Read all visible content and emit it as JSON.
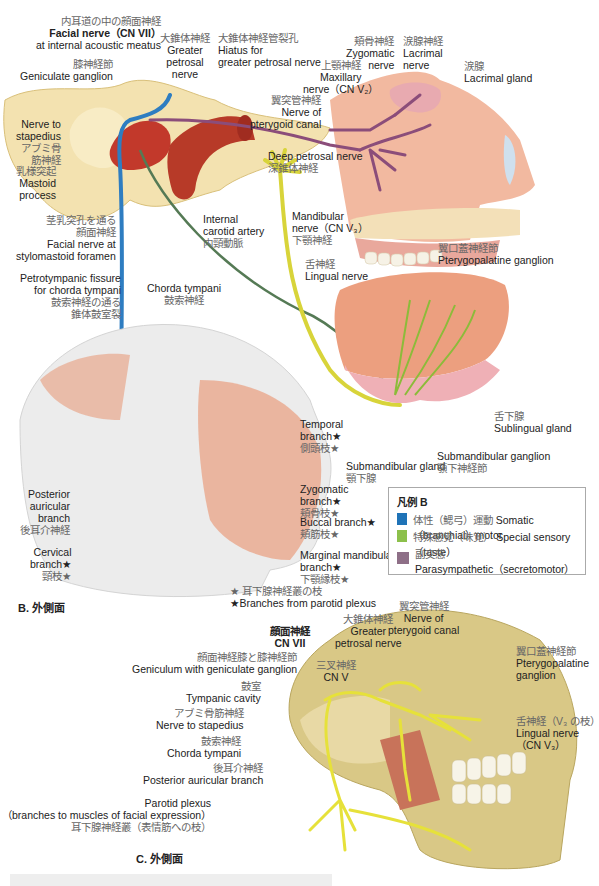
{
  "figure_B": {
    "caption": "B. 外側面",
    "labels": {
      "facial_nerve_iam": {
        "jp": "内耳道の中の顔面神経",
        "en1": "Facial nerve（CN VII）",
        "en2": "at internal acoustic meatus"
      },
      "geniculate_ganglion": {
        "jp": "膝神経節",
        "en": "Geniculate ganglion"
      },
      "greater_petrosal": {
        "jp": "大錐体神経",
        "en1": "Greater",
        "en2": "petrosal",
        "en3": "nerve"
      },
      "hiatus": {
        "jp": "大錐体神経管裂孔",
        "en1": "Hiatus for",
        "en2": "greater petrosal nerve"
      },
      "maxillary": {
        "jp": "上顎神経",
        "en1": "Maxillary",
        "en2": "nerve（CN V₂）"
      },
      "zygomatic_nerve": {
        "jp": "頬骨神経",
        "en1": "Zygomatic",
        "en2": "nerve"
      },
      "lacrimal_nerve": {
        "jp": "涙腺神経",
        "en1": "Lacrimal",
        "en2": "nerve"
      },
      "lacrimal_gland": {
        "jp": "涙腺",
        "en": "Lacrimal gland"
      },
      "pterygoid_canal": {
        "jp": "翼突管神経",
        "en1": "Nerve of",
        "en2": "pterygoid canal"
      },
      "nerve_to_stapedius": {
        "en1": "Nerve to",
        "en2": "stapedius",
        "jp1": "アブミ骨",
        "jp2": "筋神経"
      },
      "mastoid": {
        "jp": "乳様突起",
        "en1": "Mastoid",
        "en2": "process"
      },
      "deep_petrosal": {
        "en": "Deep petrosal nerve",
        "jp": "深錐体神経"
      },
      "internal_carotid": {
        "en1": "Internal",
        "en2": "carotid artery",
        "jp": "内頸動脈"
      },
      "mandibular": {
        "en1": "Mandibular",
        "en2": "nerve（CN V₃）",
        "jp": "下顎神経"
      },
      "pterygopalatine": {
        "jp": "翼口蓋神経節",
        "en": "Pterygopalatine ganglion"
      },
      "stylomastoid": {
        "jp1": "茎乳突孔を通る",
        "jp2": "顔面神経",
        "en1": "Facial nerve at",
        "en2": "stylomastoid foramen"
      },
      "lingual": {
        "jp": "舌神経",
        "en": "Lingual nerve"
      },
      "petrotympanic": {
        "en1": "Petrotympanic fissure",
        "en2": "for chorda tympani",
        "jp1": "鼓索神経の通る",
        "jp2": "錐体鼓室裂"
      },
      "chorda_tympani": {
        "en": "Chorda tympani",
        "jp": "鼓索神経"
      },
      "temporal_branch": {
        "en1": "Temporal",
        "en2": "branch★",
        "jp": "側頭枝★"
      },
      "zygomatic_branch": {
        "en1": "Zygomatic",
        "en2": "branch★",
        "jp": "頬骨枝★"
      },
      "buccal_branch": {
        "en": "Buccal branch★",
        "jp": "頬筋枝★"
      },
      "marginal_mandibular": {
        "en1": "Marginal mandibular",
        "en2": "branch★",
        "jp": "下顎縁枝★"
      },
      "posterior_auricular": {
        "en1": "Posterior",
        "en2": "auricular",
        "en3": "branch",
        "jp": "後耳介神経"
      },
      "cervical_branch": {
        "en1": "Cervical",
        "en2": "branch★",
        "jp": "頸枝★"
      },
      "submandibular_gland": {
        "en": "Submandibular gland",
        "jp": "顎下腺"
      },
      "submandibular_ganglion": {
        "en": "Submandibular ganglion",
        "jp": "顎下神経節"
      },
      "sublingual_gland": {
        "jp": "舌下腺",
        "en": "Sublingual gland"
      }
    },
    "footnote": {
      "jp": "★ 耳下腺神経叢の枝",
      "en": "★Branches from parotid plexus"
    }
  },
  "legend": {
    "title": "凡例 B",
    "items": [
      {
        "jp": "体性（鰓弓）運動",
        "en": "Somatic（branchial）motor",
        "color": "#1f73b7"
      },
      {
        "jp": "特殊感覚（味覚）",
        "en": "Special sensory（taste）",
        "color": "#8cc04b"
      },
      {
        "jp": "副交感",
        "en": "Parasympathetic（secretomotor）",
        "color": "#8e6f87"
      }
    ]
  },
  "figure_C": {
    "caption": "C. 外側面",
    "labels": {
      "facial_cn7": {
        "jp": "顔面神経",
        "en": "CN VII"
      },
      "greater_petrosal": {
        "jp": "大錐体神経",
        "en1": "Greater",
        "en2": "petrosal nerve"
      },
      "pterygoid_canal": {
        "jp": "翼突管神経",
        "en1": "Nerve of",
        "en2": "pterygoid canal"
      },
      "trigeminal": {
        "jp": "三叉神経",
        "en": "CN V"
      },
      "geniculum": {
        "jp": "顔面神経膝と膝神経節",
        "en": "Geniculum with geniculate ganglion"
      },
      "tympanic_cavity": {
        "jp": "鼓室",
        "en": "Tympanic cavity"
      },
      "nerve_to_stapedius": {
        "jp": "アブミ骨筋神経",
        "en": "Nerve to stapedius"
      },
      "chorda_tympani": {
        "jp": "鼓索神経",
        "en": "Chorda tympani"
      },
      "posterior_auricular": {
        "jp": "後耳介神経",
        "en": "Posterior auricular branch"
      },
      "pterygopalatine": {
        "jp": "翼口蓋神経節",
        "en1": "Pterygopalatine",
        "en2": "ganglion"
      },
      "lingual": {
        "jp": "舌神経（V₃ の枝）",
        "en1": "Lingual nerve",
        "en2": "（CN V₃）"
      },
      "parotid": {
        "en1": "Parotid plexus",
        "en2": "（branches to muscles of facial expression）",
        "jp": "耳下腺神経叢（表情筋への枝）"
      }
    }
  }
}
